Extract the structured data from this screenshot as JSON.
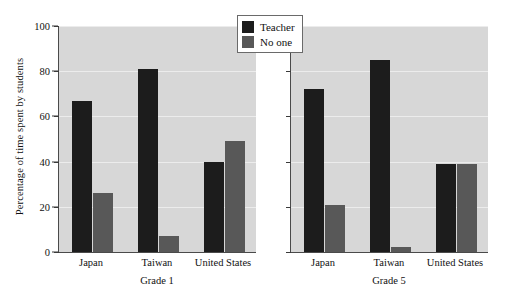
{
  "chart_data": {
    "type": "bar",
    "title": "",
    "xlabel": "",
    "ylabel": "Percentage of time spent by students",
    "ylim": [
      0,
      100
    ],
    "yticks": [
      0,
      20,
      40,
      60,
      80,
      100
    ],
    "grid": true,
    "legend_position": "top-center",
    "categories": [
      "Japan",
      "Taiwan",
      "United States"
    ],
    "panels": [
      {
        "title": "Grade 1",
        "series": [
          {
            "name": "Teacher",
            "color": "#1c1c1c",
            "values": [
              67,
              81,
              40
            ]
          },
          {
            "name": "No one",
            "color": "#585858",
            "values": [
              26,
              7,
              49
            ]
          }
        ]
      },
      {
        "title": "Grade 5",
        "series": [
          {
            "name": "Teacher",
            "color": "#1c1c1c",
            "values": [
              72,
              85,
              39
            ]
          },
          {
            "name": "No one",
            "color": "#585858",
            "values": [
              21,
              2,
              39
            ]
          }
        ]
      }
    ],
    "legend": [
      {
        "label": "Teacher",
        "color": "#1c1c1c"
      },
      {
        "label": "No one",
        "color": "#585858"
      }
    ],
    "plot_background": "#d7d7d7"
  }
}
